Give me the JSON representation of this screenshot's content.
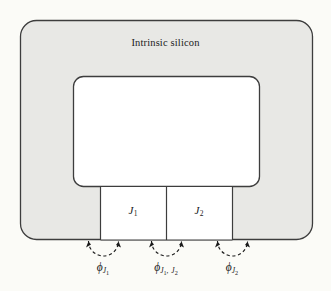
{
  "figure": {
    "kind": "cross-section-diagram",
    "region_label": "Intrinsic silicon",
    "junctions": [
      {
        "name": "J1",
        "base": "J",
        "sub": "1"
      },
      {
        "name": "J2",
        "base": "J",
        "sub": "2"
      }
    ],
    "flux_labels": [
      {
        "id": "phi-j1",
        "phi": "ϕ",
        "sub_main": "J",
        "sub_index": "1",
        "sub2_main": "",
        "sub2_index": "",
        "separator": "",
        "full_text": "ϕJ1"
      },
      {
        "id": "phi-j1j2",
        "phi": "ϕ",
        "sub_main": "J",
        "sub_index": "1",
        "separator": ", ",
        "sub2_main": "J",
        "sub2_index": "2",
        "full_text": "ϕJ1,J2"
      },
      {
        "id": "phi-j2",
        "phi": "ϕ",
        "sub_main": "J",
        "sub_index": "2",
        "sub2_main": "",
        "sub2_index": "",
        "separator": "",
        "full_text": "ϕJ2"
      }
    ],
    "colors": {
      "page_background": "#fbfbf7",
      "silicon_fill": "#e8e8e5",
      "cavity_fill": "#ffffff",
      "junction_fill": "#ffffff",
      "stroke": "#3d3d3d",
      "text": "#1a1a1a"
    },
    "geometry": {
      "outer_rect": {
        "x": 20,
        "y": 20,
        "width": 293,
        "height": 220,
        "radius": 16
      },
      "cavity_rect": {
        "x": 73,
        "y": 76,
        "width": 187,
        "height": 111,
        "radius": 10
      },
      "junction_band": {
        "x": 100,
        "y": 187,
        "width": 132,
        "height": 53
      },
      "junction_divider_x": 166,
      "arcs": [
        {
          "id": "arc-phi-j1",
          "start_x": 88,
          "end_x": 118,
          "y": 240,
          "radius": 15
        },
        {
          "id": "arc-phi-j1j2",
          "start_x": 151,
          "end_x": 181,
          "y": 240,
          "radius": 15
        },
        {
          "id": "arc-phi-j2",
          "start_x": 217,
          "end_x": 247,
          "y": 240,
          "radius": 15
        }
      ]
    }
  }
}
